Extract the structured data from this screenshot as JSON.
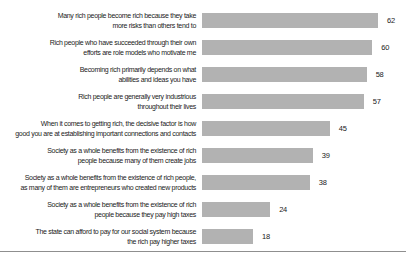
{
  "chart_data": {
    "type": "bar",
    "orientation": "horizontal",
    "title": "",
    "xlabel": "",
    "ylabel": "",
    "xlim": [
      0,
      62
    ],
    "grid": false,
    "legend": false,
    "bar_color": "#b2b2b2",
    "value_label_color": "#1a1a1a",
    "categories": [
      "Many rich people become rich because they take more risks than others tend to",
      "Rich people who have succeeded through their own efforts are role models who motivate me",
      "Becoming rich primarily depends on what abilities and ideas you have",
      "Rich people are generally very industrious throughout their lives",
      "When it comes to getting rich, the decisive factor is how good you are at establishing important connections and contacts",
      "Society as a whole benefits from the existence of rich people because many of them create jobs",
      "Society as a whole benefits from the existence of rich people, as many of them are entrepreneurs who created new products",
      "Society as a whole benefits from the existence of rich people because they pay high taxes",
      "The state can afford to pay for our social system because the rich pay higher taxes"
    ],
    "label_lines": [
      [
        "Many rich people become rich because they take",
        "more risks than others tend to"
      ],
      [
        "Rich people who have succeeded through their own",
        "efforts are role models who motivate me"
      ],
      [
        "Becoming rich primarily depends on what",
        "abilities and ideas you have"
      ],
      [
        "Rich people are generally very industrious",
        "throughout their lives"
      ],
      [
        "When it comes to getting rich, the decisive factor is how",
        "good you are at establishing important connections and contacts"
      ],
      [
        "Society as a whole benefits from the existence of rich",
        "people because many of them create jobs"
      ],
      [
        "Society as a whole benefits from the existence of rich people,",
        "as many of them are entrepreneurs who created new products"
      ],
      [
        "Society as a whole benefits from the existence of rich",
        "people because they pay high taxes"
      ],
      [
        "The state can afford to pay for our social system because",
        "the rich pay higher taxes"
      ]
    ],
    "values": [
      62,
      60,
      58,
      57,
      45,
      39,
      38,
      24,
      18
    ]
  }
}
